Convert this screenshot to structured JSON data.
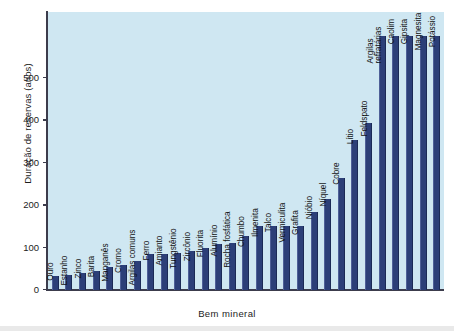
{
  "chart_data": {
    "type": "bar",
    "title": "",
    "xlabel": "Bem mineral",
    "ylabel": "Duração de reservas (anos)",
    "ylim": [
      0,
      655
    ],
    "yticks": [
      0,
      100,
      200,
      300,
      400,
      500
    ],
    "grid": false,
    "legend": "none",
    "bar_color": "#2c3f78",
    "plot_background": "#cfe7f2",
    "categories": [
      "Ouro",
      "Estanho",
      "Zinco",
      "Barita",
      "Manganês",
      "Cromo",
      "Argilas comuns",
      "Ferro",
      "Amianto",
      "Tungstênio",
      "Zircônio",
      "Fluorita",
      "Alumínio",
      "Rocha fosfática",
      "Chumbo",
      "Ilmenita",
      "Talco",
      "Vermiculita",
      "Grafita",
      "Nióbio",
      "Níquel",
      "Cobre",
      "Lítio",
      "Feldspato",
      "Argilas refratárias",
      "Caolim",
      "Gipsita",
      "Magnesita",
      "Potássio"
    ],
    "values": [
      33,
      36,
      40,
      46,
      55,
      60,
      68,
      84,
      84,
      88,
      92,
      100,
      108,
      110,
      128,
      150,
      150,
      150,
      150,
      185,
      215,
      265,
      353,
      395,
      600,
      600,
      600,
      600,
      600
    ],
    "value_notes": "Last five bars (Argilas refratárias, Caolim, Gipsita, Magnesita, Potássio) exceed the plotted axis range and are clipped at the top of the plot area."
  },
  "axis": {
    "y_title": "Duração de reservas (anos)",
    "x_title": "Bem mineral",
    "y_tick_labels": [
      "0",
      "100",
      "200",
      "300",
      "400",
      "500"
    ]
  }
}
